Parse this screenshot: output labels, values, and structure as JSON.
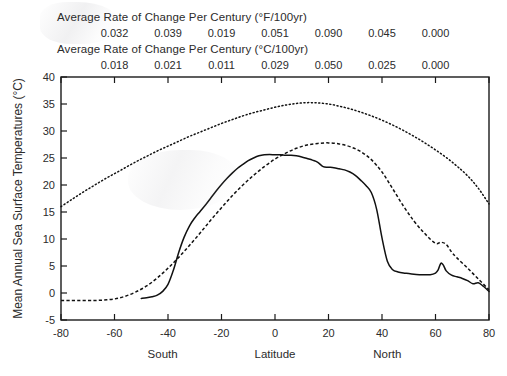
{
  "header": {
    "title_fahrenheit": "Average Rate of Change Per Century (°F/100yr)",
    "title_celsius": "Average Rate of Change Per Century (°C/100yr)",
    "rate_latitudes": [
      -60,
      -40,
      -20,
      0,
      20,
      40,
      60
    ],
    "rates_fahrenheit": [
      "0.032",
      "0.039",
      "0.019",
      "0.051",
      "0.090",
      "0.045",
      "0.000"
    ],
    "rates_celsius": [
      "0.018",
      "0.021",
      "0.011",
      "0.029",
      "0.050",
      "0.025",
      "0.000"
    ]
  },
  "axes": {
    "ylabel": "Mean Annual Sea Surface Temperatures (°C)",
    "xlabel": "Latitude",
    "xlabel_left": "South",
    "xlabel_right": "North",
    "xticks": [
      "-80",
      "-60",
      "-40",
      "-20",
      "0",
      "20",
      "40",
      "60",
      "80"
    ],
    "yticks": [
      "-5",
      "0",
      "5",
      "10",
      "15",
      "20",
      "25",
      "30",
      "35",
      "40"
    ],
    "xlim": [
      -80,
      80
    ],
    "ylim": [
      -5,
      40
    ]
  },
  "chart_data": {
    "type": "line",
    "xlabel": "Latitude",
    "ylabel": "Mean Annual Sea Surface Temperatures (°C)",
    "xlim": [
      -80,
      80
    ],
    "ylim": [
      -5,
      40
    ],
    "xticks": [
      -80,
      -60,
      -40,
      -20,
      0,
      20,
      40,
      60,
      80
    ],
    "yticks": [
      -5,
      0,
      5,
      10,
      15,
      20,
      25,
      30,
      35,
      40
    ],
    "grid": false,
    "legend": "none",
    "accent_color": "#111111",
    "series": [
      {
        "name": "upper-dotted",
        "style": "dotted",
        "x": [
          -80,
          -76,
          -72,
          -68,
          -64,
          -60,
          -56,
          -52,
          -48,
          -44,
          -40,
          -36,
          -32,
          -28,
          -24,
          -20,
          -16,
          -12,
          -8,
          -4,
          0,
          4,
          8,
          12,
          16,
          20,
          24,
          28,
          32,
          36,
          40,
          44,
          48,
          52,
          56,
          60,
          64,
          68,
          72,
          76,
          80
        ],
        "y": [
          16.0,
          17.3,
          18.6,
          19.8,
          21.0,
          22.1,
          23.2,
          24.3,
          25.3,
          26.3,
          27.2,
          28.1,
          29.0,
          29.8,
          30.6,
          31.4,
          32.1,
          32.8,
          33.4,
          33.9,
          34.4,
          34.8,
          35.1,
          35.25,
          35.2,
          35.0,
          34.6,
          34.1,
          33.5,
          32.8,
          32.0,
          31.1,
          30.1,
          29.0,
          27.8,
          26.5,
          25.1,
          23.5,
          21.7,
          19.4,
          16.5
        ]
      },
      {
        "name": "middle-dashed",
        "style": "dashed",
        "x": [
          -80,
          -76,
          -72,
          -68,
          -64,
          -60,
          -56,
          -52,
          -48,
          -44,
          -40,
          -36,
          -32,
          -28,
          -24,
          -20,
          -16,
          -12,
          -8,
          -4,
          0,
          4,
          8,
          12,
          16,
          20,
          24,
          28,
          32,
          36,
          40,
          44,
          48,
          52,
          56,
          60,
          62,
          64,
          66,
          68,
          72,
          76,
          80
        ],
        "y": [
          -1.4,
          -1.4,
          -1.4,
          -1.4,
          -1.3,
          -1.1,
          -0.6,
          0.2,
          1.3,
          2.8,
          4.6,
          6.6,
          8.8,
          11.1,
          13.5,
          15.8,
          18.0,
          20.0,
          21.8,
          23.4,
          24.8,
          25.9,
          26.8,
          27.4,
          27.7,
          27.8,
          27.6,
          27.1,
          26.2,
          24.7,
          22.4,
          19.3,
          16.1,
          13.3,
          11.0,
          9.2,
          9.4,
          9.0,
          7.6,
          6.5,
          4.6,
          2.6,
          0.6
        ]
      },
      {
        "name": "lower-solid",
        "style": "solid",
        "x": [
          -50,
          -48,
          -46,
          -44,
          -42,
          -40,
          -38,
          -36,
          -34,
          -32,
          -30,
          -28,
          -26,
          -24,
          -22,
          -20,
          -18,
          -16,
          -14,
          -12,
          -10,
          -8,
          -6,
          -4,
          -2,
          0,
          2,
          4,
          6,
          8,
          10,
          12,
          14,
          16,
          18,
          20,
          22,
          24,
          26,
          28,
          30,
          32,
          34,
          36,
          38,
          40,
          42,
          44,
          46,
          48,
          50,
          54,
          58,
          60,
          61,
          62,
          63,
          64,
          66,
          68,
          70,
          72,
          74,
          76,
          78,
          80
        ],
        "y": [
          -1.0,
          -0.9,
          -0.7,
          -0.4,
          0.3,
          1.6,
          4.2,
          7.5,
          10.3,
          12.4,
          13.9,
          15.1,
          16.3,
          17.6,
          18.9,
          20.1,
          21.2,
          22.2,
          23.1,
          23.8,
          24.5,
          25.0,
          25.4,
          25.6,
          25.65,
          25.6,
          25.6,
          25.5,
          25.5,
          25.4,
          25.2,
          24.9,
          24.6,
          24.2,
          23.4,
          23.3,
          23.2,
          23.0,
          22.8,
          22.4,
          21.8,
          20.9,
          19.9,
          18.6,
          15.5,
          10.2,
          5.9,
          4.3,
          3.9,
          3.7,
          3.6,
          3.4,
          3.4,
          3.7,
          4.3,
          5.5,
          5.1,
          4.1,
          3.3,
          3.0,
          2.7,
          2.3,
          1.7,
          1.9,
          1.2,
          0.3
        ]
      }
    ]
  }
}
